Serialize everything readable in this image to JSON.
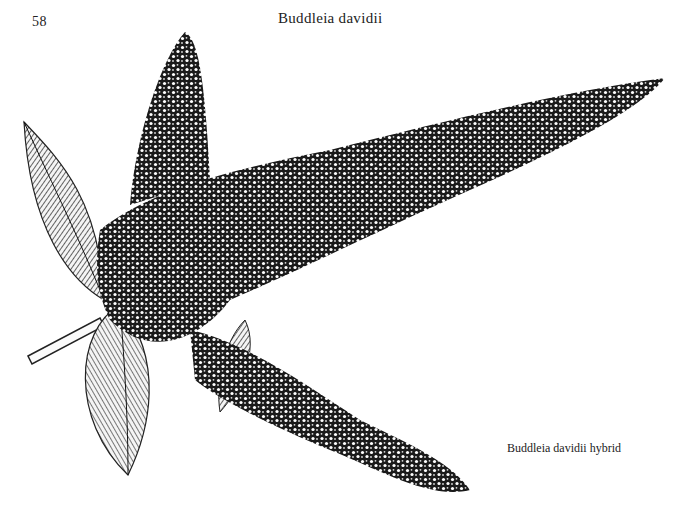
{
  "page": {
    "number": "58",
    "running_head": "Buddleia davidii",
    "caption": "Buddleia davidii hybrid"
  },
  "illustration": {
    "subject": "Buddleia davidii hybrid flowering branch",
    "style": "black-and-white engraving"
  }
}
